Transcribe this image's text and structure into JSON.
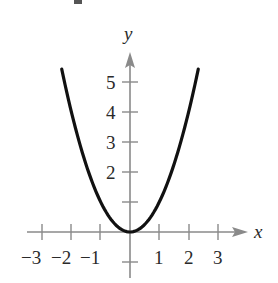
{
  "chart_data": {
    "type": "line",
    "title": "",
    "function": "y = x^2",
    "xlabel": "x",
    "ylabel": "y",
    "xlim": [
      -3.5,
      4.0
    ],
    "ylim": [
      -0.8,
      6.0
    ],
    "grid": false,
    "legend": null,
    "x_ticks": [
      -3,
      -2,
      -1,
      1,
      2,
      3
    ],
    "x_tick_labels": [
      "−3",
      "−2",
      "−1",
      "1",
      "2",
      "3"
    ],
    "y_ticks": [
      1,
      2,
      3,
      4,
      5,
      -0.5
    ],
    "y_tick_labels": [
      "",
      "2",
      "3",
      "4",
      "5"
    ],
    "series": [
      {
        "name": "y = x^2",
        "x": [
          -2.33,
          -2,
          -1.5,
          -1,
          -0.5,
          0,
          0.5,
          1,
          1.5,
          2,
          2.33
        ],
        "y": [
          5.43,
          4,
          2.25,
          1,
          0.25,
          0,
          0.25,
          1,
          2.25,
          4,
          5.43
        ]
      }
    ]
  },
  "colors": {
    "curve": "#111111",
    "axis": "#8a8a8a",
    "text": "#2a2a2a"
  },
  "labels": {
    "x_axis": "x",
    "y_axis": "y",
    "xt_m3": "−3",
    "xt_m2": "−2",
    "xt_m1": "−1",
    "xt_1": "1",
    "xt_2": "2",
    "xt_3": "3",
    "yt_2": "2",
    "yt_3": "3",
    "yt_4": "4",
    "yt_5": "5"
  }
}
